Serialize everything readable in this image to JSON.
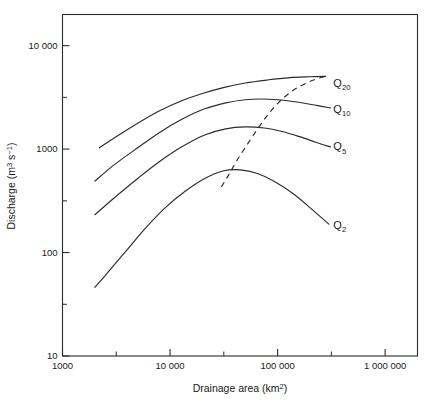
{
  "chart_data": {
    "type": "line",
    "title": "",
    "xlabel": "Drainage area (km2)",
    "xlabel_base": "Drainage area (km",
    "xlabel_sup": "2",
    "xlabel_tail": ")",
    "ylabel": "Discharge (m3 s-1)",
    "ylabel_base": "Discharge (m",
    "ylabel_sup1": "3",
    "ylabel_mid": " s",
    "ylabel_sup2": "−1",
    "ylabel_tail": ")",
    "xscale": "log",
    "yscale": "log",
    "xlim": [
      1000,
      2000000
    ],
    "ylim": [
      10,
      20000
    ],
    "grid": false,
    "legend_position": "inline-right-end-of-curve",
    "x_ticks": [
      {
        "value": 1000,
        "label": "1000",
        "type": "major"
      },
      {
        "value": 3162,
        "label": "",
        "type": "minor"
      },
      {
        "value": 10000,
        "label": "10 000",
        "type": "major"
      },
      {
        "value": 31620,
        "label": "",
        "type": "minor"
      },
      {
        "value": 100000,
        "label": "100 000",
        "type": "major"
      },
      {
        "value": 316200,
        "label": "",
        "type": "minor"
      },
      {
        "value": 1000000,
        "label": "1 000 000",
        "type": "major"
      }
    ],
    "y_ticks": [
      {
        "value": 10000,
        "label": "10 000",
        "type": "major"
      },
      {
        "value": 3162,
        "label": "",
        "type": "minor"
      },
      {
        "value": 1000,
        "label": "1000",
        "type": "major"
      },
      {
        "value": 316,
        "label": "",
        "type": "minor"
      },
      {
        "value": 100,
        "label": "100",
        "type": "major"
      },
      {
        "value": 31.6,
        "label": "",
        "type": "minor"
      },
      {
        "value": 10,
        "label": "10",
        "type": "major"
      }
    ],
    "series": [
      {
        "name": "Q20",
        "label_base": "Q",
        "label_sub": "20",
        "style": "solid",
        "label_at": {
          "x": 330000,
          "y": 4400
        },
        "points": [
          {
            "x": 2200,
            "y": 1030
          },
          {
            "x": 3200,
            "y": 1330
          },
          {
            "x": 5000,
            "y": 1780
          },
          {
            "x": 8000,
            "y": 2350
          },
          {
            "x": 13000,
            "y": 2950
          },
          {
            "x": 20000,
            "y": 3450
          },
          {
            "x": 32000,
            "y": 3950
          },
          {
            "x": 50000,
            "y": 4350
          },
          {
            "x": 80000,
            "y": 4650
          },
          {
            "x": 130000,
            "y": 4900
          },
          {
            "x": 200000,
            "y": 5000
          },
          {
            "x": 280000,
            "y": 5050
          }
        ]
      },
      {
        "name": "Q10",
        "label_base": "Q",
        "label_sub": "10",
        "style": "solid",
        "label_at": {
          "x": 330000,
          "y": 2450
        },
        "points": [
          {
            "x": 2000,
            "y": 490
          },
          {
            "x": 3000,
            "y": 700
          },
          {
            "x": 5000,
            "y": 1030
          },
          {
            "x": 8000,
            "y": 1450
          },
          {
            "x": 13000,
            "y": 1950
          },
          {
            "x": 21000,
            "y": 2450
          },
          {
            "x": 33000,
            "y": 2800
          },
          {
            "x": 50000,
            "y": 3000
          },
          {
            "x": 70000,
            "y": 3050
          },
          {
            "x": 100000,
            "y": 3000
          },
          {
            "x": 150000,
            "y": 2850
          },
          {
            "x": 230000,
            "y": 2650
          },
          {
            "x": 310000,
            "y": 2500
          }
        ]
      },
      {
        "name": "Q5",
        "label_base": "Q",
        "label_sub": "5",
        "style": "solid",
        "label_at": {
          "x": 330000,
          "y": 1060
        },
        "points": [
          {
            "x": 2000,
            "y": 232
          },
          {
            "x": 3000,
            "y": 335
          },
          {
            "x": 5000,
            "y": 520
          },
          {
            "x": 8000,
            "y": 760
          },
          {
            "x": 13000,
            "y": 1060
          },
          {
            "x": 21000,
            "y": 1370
          },
          {
            "x": 33000,
            "y": 1570
          },
          {
            "x": 50000,
            "y": 1640
          },
          {
            "x": 75000,
            "y": 1600
          },
          {
            "x": 110000,
            "y": 1480
          },
          {
            "x": 160000,
            "y": 1320
          },
          {
            "x": 230000,
            "y": 1160
          },
          {
            "x": 310000,
            "y": 1050
          }
        ]
      },
      {
        "name": "Q2",
        "label_base": "Q",
        "label_sub": "2",
        "style": "solid",
        "label_at": {
          "x": 330000,
          "y": 185
        },
        "points": [
          {
            "x": 2000,
            "y": 46
          },
          {
            "x": 2700,
            "y": 66
          },
          {
            "x": 4000,
            "y": 107
          },
          {
            "x": 6000,
            "y": 175
          },
          {
            "x": 9000,
            "y": 270
          },
          {
            "x": 14000,
            "y": 395
          },
          {
            "x": 21000,
            "y": 520
          },
          {
            "x": 31000,
            "y": 615
          },
          {
            "x": 45000,
            "y": 630
          },
          {
            "x": 65000,
            "y": 580
          },
          {
            "x": 95000,
            "y": 480
          },
          {
            "x": 140000,
            "y": 370
          },
          {
            "x": 210000,
            "y": 260
          },
          {
            "x": 300000,
            "y": 188
          }
        ]
      },
      {
        "name": "envelope",
        "label_base": "",
        "label_sub": "",
        "style": "dashed",
        "label_at": null,
        "points": [
          {
            "x": 30000,
            "y": 430
          },
          {
            "x": 35000,
            "y": 560
          },
          {
            "x": 42000,
            "y": 780
          },
          {
            "x": 52000,
            "y": 1100
          },
          {
            "x": 65000,
            "y": 1560
          },
          {
            "x": 82000,
            "y": 2180
          },
          {
            "x": 105000,
            "y": 2900
          },
          {
            "x": 140000,
            "y": 3700
          },
          {
            "x": 190000,
            "y": 4400
          },
          {
            "x": 250000,
            "y": 4900
          },
          {
            "x": 300000,
            "y": 5080
          }
        ]
      }
    ],
    "colors": {
      "line": "#2b2b2b",
      "axis": "#2b2b2b",
      "background": "#ffffff"
    }
  }
}
